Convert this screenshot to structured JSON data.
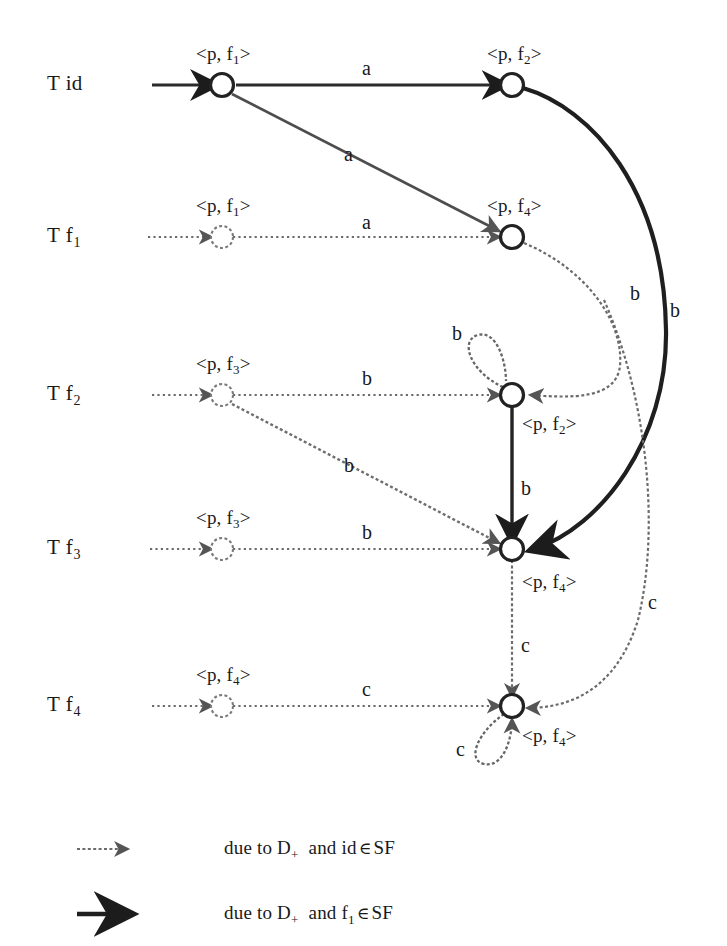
{
  "figure": {
    "type": "automaton-transition-diagram",
    "width": 727,
    "height": 946,
    "background": "#ffffff",
    "ink_color": "#262626",
    "thin_color": "#4a4a4a"
  },
  "rows": [
    {
      "id": "row-id",
      "label_t": "T",
      "label_f": "id",
      "label_sub": "",
      "y": 85
    },
    {
      "id": "row-f1",
      "label_t": "T",
      "label_f": "f",
      "label_sub": "1",
      "y": 237
    },
    {
      "id": "row-f2",
      "label_t": "T",
      "label_f": "f",
      "label_sub": "2",
      "y": 395
    },
    {
      "id": "row-f3",
      "label_t": "T",
      "label_f": "f",
      "label_sub": "3",
      "y": 549
    },
    {
      "id": "row-f4",
      "label_t": "T",
      "label_f": "f",
      "label_sub": "4",
      "y": 706
    }
  ],
  "states": [
    {
      "id": "s-id-f1",
      "row": "row-id",
      "x": 222,
      "y": 85,
      "style": "solid",
      "label": "<p, f",
      "label_sub": "1",
      "label_close": ">",
      "label_x": 196,
      "label_y": 44
    },
    {
      "id": "s-id-f2",
      "row": "row-id",
      "x": 512,
      "y": 85,
      "style": "solid",
      "label": "<p, f",
      "label_sub": "2",
      "label_close": ">",
      "label_x": 487,
      "label_y": 44
    },
    {
      "id": "s-f1-f1",
      "row": "row-f1",
      "x": 222,
      "y": 237,
      "style": "light",
      "label": "<p, f",
      "label_sub": "1",
      "label_close": ">",
      "label_x": 196,
      "label_y": 196
    },
    {
      "id": "s-f1-f4",
      "row": "row-f1",
      "x": 512,
      "y": 237,
      "style": "solid",
      "label": "<p, f",
      "label_sub": "4",
      "label_close": ">",
      "label_x": 487,
      "label_y": 196
    },
    {
      "id": "s-f2-f3",
      "row": "row-f2",
      "x": 222,
      "y": 395,
      "style": "light",
      "label": "<p, f",
      "label_sub": "3",
      "label_close": ">",
      "label_x": 196,
      "label_y": 354
    },
    {
      "id": "s-f2-f2",
      "row": "row-f2",
      "x": 512,
      "y": 395,
      "style": "solid",
      "label": "<p, f",
      "label_sub": "2",
      "label_close": ">",
      "label_x": 522,
      "label_y": 414
    },
    {
      "id": "s-f3-f3",
      "row": "row-f3",
      "x": 222,
      "y": 549,
      "style": "light",
      "label": "<p, f",
      "label_sub": "3",
      "label_close": ">",
      "label_x": 196,
      "label_y": 508
    },
    {
      "id": "s-f3-f4",
      "row": "row-f3",
      "x": 512,
      "y": 549,
      "style": "solid",
      "label": "<p, f",
      "label_sub": "4",
      "label_close": ">",
      "label_x": 522,
      "label_y": 572
    },
    {
      "id": "s-f4-f4a",
      "row": "row-f4",
      "x": 222,
      "y": 706,
      "style": "light",
      "label": "<p, f",
      "label_sub": "4",
      "label_close": ">",
      "label_x": 196,
      "label_y": 665
    },
    {
      "id": "s-f4-f4b",
      "row": "row-f4",
      "x": 512,
      "y": 706,
      "style": "solid",
      "label": "<p, f",
      "label_sub": "4",
      "label_close": ">",
      "label_x": 522,
      "label_y": 726
    }
  ],
  "edge_labels": [
    {
      "id": "lbl-a-top",
      "text": "a",
      "x": 362,
      "y": 58
    },
    {
      "id": "lbl-a-diag",
      "text": "a",
      "x": 344,
      "y": 144
    },
    {
      "id": "lbl-a-f1",
      "text": "a",
      "x": 362,
      "y": 212
    },
    {
      "id": "lbl-b-loop2",
      "text": "b",
      "x": 452,
      "y": 323
    },
    {
      "id": "lbl-b-f2",
      "text": "b",
      "x": 362,
      "y": 368
    },
    {
      "id": "lbl-b-diag",
      "text": "b",
      "x": 344,
      "y": 455
    },
    {
      "id": "lbl-b-f3",
      "text": "b",
      "x": 362,
      "y": 522
    },
    {
      "id": "lbl-b-vert",
      "text": "b",
      "x": 521,
      "y": 478
    },
    {
      "id": "lbl-b-thin",
      "text": "b",
      "x": 630,
      "y": 283
    },
    {
      "id": "lbl-b-thick",
      "text": "b",
      "x": 670,
      "y": 300
    },
    {
      "id": "lbl-c-f4",
      "text": "c",
      "x": 362,
      "y": 679
    },
    {
      "id": "lbl-c-vert",
      "text": "c",
      "x": 521,
      "y": 635
    },
    {
      "id": "lbl-c-right",
      "text": "c",
      "x": 648,
      "y": 592
    },
    {
      "id": "lbl-c-loop4",
      "text": "c",
      "x": 456,
      "y": 739
    }
  ],
  "legend": [
    {
      "id": "legend-thin",
      "marker": "thin-arrow",
      "prefix": "due to D",
      "sub": "+",
      "middle": "and  id",
      "elem": "∈",
      "suffix": "SF",
      "suffix_sub": ""
    },
    {
      "id": "legend-thick",
      "marker": "thick-arrow",
      "prefix": "due to D",
      "sub": "+",
      "middle": "and  f",
      "elem": "∈",
      "suffix": "SF",
      "suffix_sub": "1"
    }
  ]
}
